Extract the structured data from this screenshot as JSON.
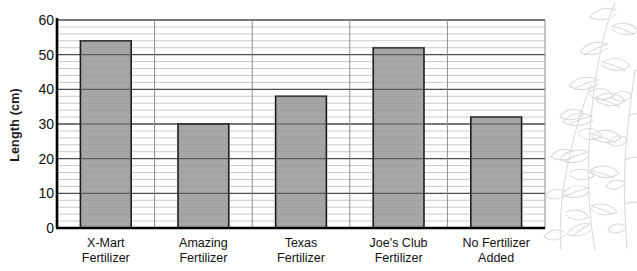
{
  "chart_data": {
    "type": "bar",
    "title": "",
    "xlabel": "",
    "ylabel": "Length (cm)",
    "categories": [
      "X-Mart\nFertilizer",
      "Amazing\nFertilizer",
      "Texas\nFertilizer",
      "Joe's Club\nFertilizer",
      "No Fertilizer\nAdded"
    ],
    "category_lines": [
      [
        "X-Mart",
        "Fertilizer"
      ],
      [
        "Amazing",
        "Fertilizer"
      ],
      [
        "Texas",
        "Fertilizer"
      ],
      [
        "Joe's Club",
        "Fertilizer"
      ],
      [
        "No Fertilizer",
        "Added"
      ]
    ],
    "values": [
      54,
      30,
      38,
      52,
      32
    ],
    "ylim": [
      0,
      60
    ],
    "ytick_labels": [
      "0",
      "10",
      "20",
      "30",
      "40",
      "50",
      "60"
    ],
    "ytick_values": [
      0,
      10,
      20,
      30,
      40,
      50,
      60
    ],
    "y_major_step": 10,
    "y_minor_step": 2,
    "grid": "horizontal-major-and-minor, vertical-category-separators",
    "legend": "none",
    "bar_fill_color": "#a6a6a6",
    "bar_border_color": "#1a1a1a",
    "major_gridline_color": "#4d4d4d",
    "minor_gridline_color": "#c9c9c9",
    "axis_color": "#000000",
    "background_color": "#ffffff",
    "decoration": "plant-leaf-line-drawing"
  },
  "figure": {
    "axis_label_y": "Length (cm)",
    "decoration_name": "plant-branch-illustration"
  }
}
